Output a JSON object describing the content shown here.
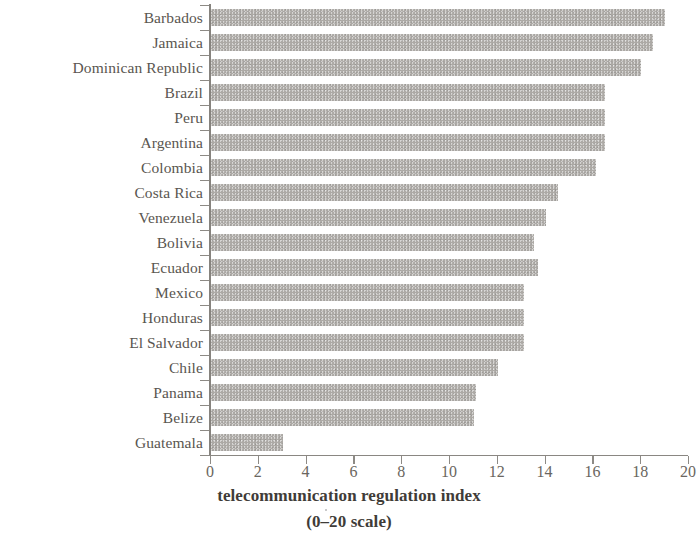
{
  "figure": {
    "bar_color": "#a9a6a2",
    "axis_color": "#8a8782",
    "text_color": "#5a5650",
    "caption_line1": "telecommunication regulation index",
    "caption_line2": "(0–20 scale)"
  },
  "chart_data": {
    "type": "bar",
    "orientation": "horizontal",
    "title": "",
    "subtitle": "",
    "xlabel": "telecommunication regulation index (0–20 scale)",
    "ylabel": "",
    "xlim": [
      0,
      20
    ],
    "ylim": null,
    "xticks": [
      0,
      2,
      4,
      6,
      8,
      10,
      12,
      14,
      16,
      18,
      20
    ],
    "xtick_labels": [
      "0",
      "2",
      "4",
      "6",
      "8",
      "10",
      "12",
      "14",
      "16",
      "18",
      "20"
    ],
    "grid": false,
    "legend": null,
    "legend_position": "none",
    "categories": [
      "Barbados",
      "Jamaica",
      "Dominican Republic",
      "Brazil",
      "Peru",
      "Argentina",
      "Colombia",
      "Costa Rica",
      "Venezuela",
      "Bolivia",
      "Ecuador",
      "Mexico",
      "Honduras",
      "El Salvador",
      "Chile",
      "Panama",
      "Belize",
      "Guatemala"
    ],
    "values": [
      19.0,
      18.5,
      18.0,
      16.5,
      16.5,
      16.5,
      16.1,
      14.5,
      14.0,
      13.5,
      13.7,
      13.1,
      13.1,
      13.1,
      12.0,
      11.1,
      11.0,
      3.0
    ]
  }
}
